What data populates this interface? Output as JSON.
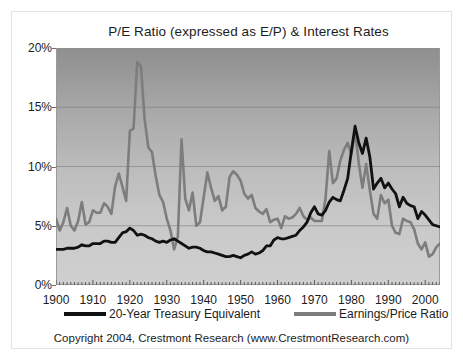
{
  "chart_data": {
    "type": "line",
    "title": "P/E Ratio (expressed as E/P) & Interest Rates",
    "xlabel": "",
    "ylabel": "",
    "xlim": [
      1900,
      2004
    ],
    "ylim": [
      0,
      20
    ],
    "yticks": [
      "0%",
      "5%",
      "10%",
      "15%",
      "20%"
    ],
    "ytick_values": [
      0,
      5,
      10,
      15,
      20
    ],
    "xticks": [
      "1900",
      "1910",
      "1920",
      "1930",
      "1940",
      "1950",
      "1960",
      "1970",
      "1980",
      "1990",
      "2000"
    ],
    "xtick_values": [
      1900,
      1910,
      1920,
      1930,
      1940,
      1950,
      1960,
      1970,
      1980,
      1990,
      2000
    ],
    "grid": true,
    "legend_position": "below-axis",
    "series": [
      {
        "name": "20-Year Treasury Equivalent",
        "color": "#111111",
        "x": [
          1900,
          1901,
          1902,
          1903,
          1904,
          1905,
          1906,
          1907,
          1908,
          1909,
          1910,
          1911,
          1912,
          1913,
          1914,
          1915,
          1916,
          1917,
          1918,
          1919,
          1920,
          1921,
          1922,
          1923,
          1924,
          1925,
          1926,
          1927,
          1928,
          1929,
          1930,
          1931,
          1932,
          1933,
          1934,
          1935,
          1936,
          1937,
          1938,
          1939,
          1940,
          1941,
          1942,
          1943,
          1944,
          1945,
          1946,
          1947,
          1948,
          1949,
          1950,
          1951,
          1952,
          1953,
          1954,
          1955,
          1956,
          1957,
          1958,
          1959,
          1960,
          1961,
          1962,
          1963,
          1964,
          1965,
          1966,
          1967,
          1968,
          1969,
          1970,
          1971,
          1972,
          1973,
          1974,
          1975,
          1976,
          1977,
          1978,
          1979,
          1980,
          1981,
          1982,
          1983,
          1984,
          1985,
          1986,
          1987,
          1988,
          1989,
          1990,
          1991,
          1992,
          1993,
          1994,
          1995,
          1996,
          1997,
          1998,
          1999,
          2000,
          2001,
          2002,
          2003,
          2004
        ],
        "values": [
          3.0,
          3.0,
          3.0,
          3.1,
          3.1,
          3.1,
          3.2,
          3.4,
          3.3,
          3.3,
          3.5,
          3.5,
          3.5,
          3.7,
          3.7,
          3.6,
          3.6,
          4.0,
          4.4,
          4.5,
          4.8,
          4.6,
          4.2,
          4.3,
          4.2,
          4.0,
          3.9,
          3.7,
          3.6,
          3.7,
          3.6,
          3.8,
          3.9,
          3.7,
          3.5,
          3.3,
          3.1,
          3.2,
          3.2,
          3.1,
          2.9,
          2.8,
          2.8,
          2.7,
          2.6,
          2.5,
          2.4,
          2.4,
          2.5,
          2.4,
          2.3,
          2.5,
          2.6,
          2.8,
          2.6,
          2.7,
          2.9,
          3.3,
          3.3,
          3.8,
          4.0,
          3.9,
          3.9,
          4.0,
          4.1,
          4.2,
          4.6,
          4.9,
          5.3,
          6.1,
          6.6,
          6.0,
          5.9,
          6.3,
          7.0,
          7.4,
          7.2,
          7.1,
          8.0,
          9.0,
          11.3,
          13.4,
          12.0,
          11.1,
          12.4,
          10.8,
          8.1,
          8.6,
          9.0,
          8.2,
          8.6,
          8.1,
          7.7,
          6.6,
          7.4,
          6.9,
          6.7,
          6.6,
          5.6,
          6.2,
          5.9,
          5.5,
          5.1,
          5.0,
          4.9
        ]
      },
      {
        "name": "Earnings/Price Ratio",
        "color": "#7d7d7d",
        "x": [
          1900,
          1901,
          1902,
          1903,
          1904,
          1905,
          1906,
          1907,
          1908,
          1909,
          1910,
          1911,
          1912,
          1913,
          1914,
          1915,
          1916,
          1917,
          1918,
          1919,
          1920,
          1921,
          1922,
          1923,
          1924,
          1925,
          1926,
          1927,
          1928,
          1929,
          1930,
          1931,
          1932,
          1933,
          1934,
          1935,
          1936,
          1937,
          1938,
          1939,
          1940,
          1941,
          1942,
          1943,
          1944,
          1945,
          1946,
          1947,
          1948,
          1949,
          1950,
          1951,
          1952,
          1953,
          1954,
          1955,
          1956,
          1957,
          1958,
          1959,
          1960,
          1961,
          1962,
          1963,
          1964,
          1965,
          1966,
          1967,
          1968,
          1969,
          1970,
          1971,
          1972,
          1973,
          1974,
          1975,
          1976,
          1977,
          1978,
          1979,
          1980,
          1981,
          1982,
          1983,
          1984,
          1985,
          1986,
          1987,
          1988,
          1989,
          1990,
          1991,
          1992,
          1993,
          1994,
          1995,
          1996,
          1997,
          1998,
          1999,
          2000,
          2001,
          2002,
          2003,
          2004
        ],
        "values": [
          5.6,
          4.6,
          5.3,
          6.5,
          5.0,
          4.6,
          5.4,
          7.0,
          5.1,
          5.3,
          6.3,
          6.1,
          6.1,
          6.9,
          6.6,
          6.0,
          8.3,
          9.4,
          8.3,
          7.1,
          13.0,
          13.2,
          18.8,
          18.5,
          14.0,
          11.6,
          11.2,
          9.2,
          7.6,
          7.0,
          5.6,
          4.6,
          3.0,
          4.1,
          12.3,
          7.3,
          6.3,
          7.8,
          5.0,
          5.3,
          7.4,
          9.5,
          8.2,
          7.1,
          7.5,
          6.3,
          6.6,
          9.1,
          9.6,
          9.3,
          8.8,
          7.7,
          7.3,
          7.6,
          6.5,
          6.2,
          6.0,
          6.4,
          5.3,
          5.5,
          5.6,
          4.8,
          5.8,
          5.6,
          5.7,
          6.0,
          6.5,
          5.8,
          5.5,
          5.7,
          5.4,
          5.4,
          5.4,
          7.3,
          11.3,
          8.6,
          9.0,
          10.5,
          11.4,
          12.0,
          11.0,
          13.0,
          10.3,
          8.2,
          10.2,
          8.0,
          6.0,
          5.6,
          7.6,
          6.9,
          7.2,
          5.0,
          4.4,
          4.3,
          5.6,
          5.4,
          5.3,
          4.7,
          3.5,
          3.0,
          3.6,
          2.4,
          2.6,
          3.2,
          3.5
        ]
      }
    ]
  },
  "footer": {
    "copyright": "Copyright 2004, Crestmont Research (www.CrestmontResearch.com)"
  }
}
